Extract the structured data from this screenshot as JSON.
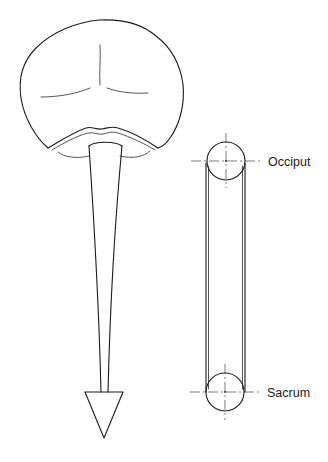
{
  "figure": {
    "type": "anatomical-line-diagram",
    "left_panel": {
      "subject": "brain-with-spinal-cord-arrow",
      "parts": [
        "cerebrum",
        "central-sulcus",
        "lateral-sulci",
        "cerebellum-fold",
        "brainstem-stem",
        "arrowhead"
      ]
    },
    "right_panel": {
      "subject": "craniosacral-pulley-model",
      "labels": {
        "top": "Occiput",
        "bottom": "Sacrum"
      }
    }
  },
  "colors": {
    "line": "#1a1a1a",
    "background": "#ffffff"
  }
}
